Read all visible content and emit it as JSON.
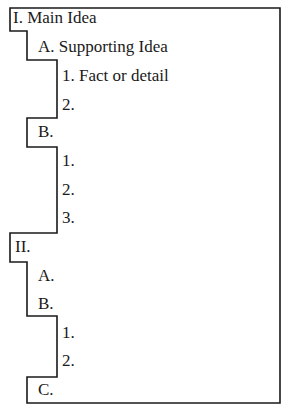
{
  "outline": {
    "items": [
      {
        "label": "I. Main Idea",
        "level": 0,
        "x": 13,
        "y": 8
      },
      {
        "label": "A. Supporting Idea",
        "level": 1,
        "x": 38,
        "y": 37
      },
      {
        "label": "1. Fact or detail",
        "level": 2,
        "x": 62,
        "y": 66
      },
      {
        "label": "2.",
        "level": 2,
        "x": 62,
        "y": 95
      },
      {
        "label": "B.",
        "level": 1,
        "x": 38,
        "y": 122
      },
      {
        "label": "1.",
        "level": 2,
        "x": 62,
        "y": 151
      },
      {
        "label": "2.",
        "level": 2,
        "x": 62,
        "y": 180
      },
      {
        "label": "3.",
        "level": 2,
        "x": 62,
        "y": 208
      },
      {
        "label": "II.",
        "level": 0,
        "x": 15,
        "y": 237
      },
      {
        "label": "A.",
        "level": 1,
        "x": 38,
        "y": 266
      },
      {
        "label": "B.",
        "level": 1,
        "x": 38,
        "y": 294
      },
      {
        "label": "1.",
        "level": 2,
        "x": 62,
        "y": 323
      },
      {
        "label": "2.",
        "level": 2,
        "x": 62,
        "y": 351
      },
      {
        "label": "C.",
        "level": 1,
        "x": 38,
        "y": 380
      }
    ]
  },
  "colors": {
    "line": "#1a1a1a",
    "background": "#ffffff"
  }
}
